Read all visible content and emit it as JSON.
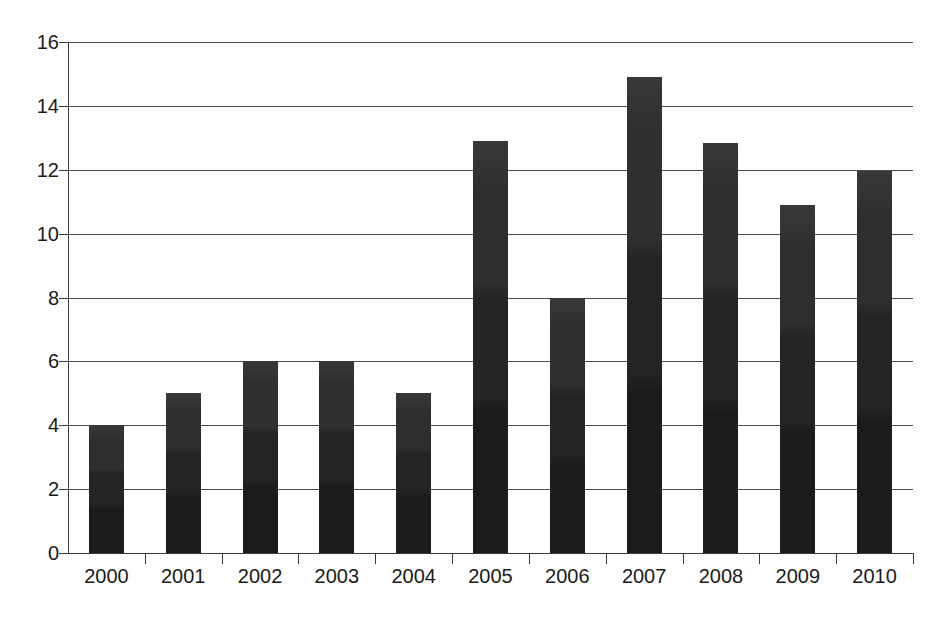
{
  "chart_data": {
    "type": "bar",
    "title": "",
    "subtitle": "",
    "xlabel": "",
    "ylabel": "",
    "categories": [
      "2000",
      "2001",
      "2002",
      "2003",
      "2004",
      "2005",
      "2006",
      "2007",
      "2008",
      "2009",
      "2010"
    ],
    "values": [
      4.0,
      5.0,
      6.0,
      6.0,
      5.0,
      12.9,
      8.0,
      14.9,
      12.85,
      10.9,
      11.95
    ],
    "series": [
      {
        "name": "",
        "values": [
          4.0,
          5.0,
          6.0,
          6.0,
          5.0,
          12.9,
          8.0,
          14.9,
          12.85,
          10.9,
          11.95
        ]
      }
    ],
    "ylim": [
      0,
      16
    ],
    "yticks": [
      0,
      2,
      4,
      6,
      8,
      10,
      12,
      14,
      16
    ],
    "ytick_labels": [
      "0",
      "2",
      "4",
      "6",
      "8",
      "10",
      "12",
      "14",
      "16"
    ],
    "grid": true,
    "grid_axis": "y",
    "legend": false,
    "legend_position": "none",
    "bar_color": "#1b1b1b",
    "axis_color": "#3a3a3a",
    "grid_color": "#4a4a4a",
    "background_color": "#ffffff"
  }
}
